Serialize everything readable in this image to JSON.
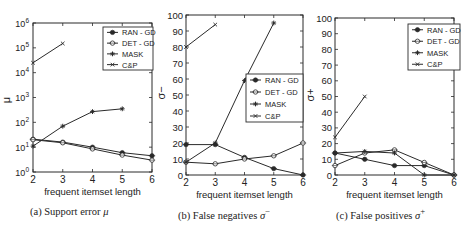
{
  "chart_data": [
    {
      "id": "a",
      "type": "line",
      "title": "",
      "caption": "(a) Support error μ",
      "caption_prefix": "(a)  Support error ",
      "caption_symbol": "μ",
      "xlabel": "frequent itemset length",
      "ylabel": "μ",
      "yscale": "log",
      "x_ticks": [
        2,
        3,
        4,
        5,
        6
      ],
      "y_ticks": [
        1,
        10,
        100,
        1000,
        10000,
        100000,
        1000000
      ],
      "y_tick_labels": [
        "10^0",
        "10^1",
        "10^2",
        "10^3",
        "10^4",
        "10^5",
        "10^6"
      ],
      "xlim": [
        2,
        6
      ],
      "ylim": [
        1,
        1000000
      ],
      "legend_position": "upper right",
      "series": [
        {
          "name": "RAN-GD",
          "marker": "filled-circle",
          "x": [
            2,
            3,
            4,
            5,
            6
          ],
          "values": [
            21,
            16,
            10,
            6,
            4.5
          ]
        },
        {
          "name": "DET-GD",
          "marker": "open-circle",
          "x": [
            2,
            3,
            4,
            5,
            6
          ],
          "values": [
            20,
            15,
            8.5,
            4.8,
            3
          ]
        },
        {
          "name": "MASK",
          "marker": "star",
          "x": [
            2,
            3,
            4,
            5
          ],
          "values": [
            11,
            70,
            270,
            350
          ]
        },
        {
          "name": "C&P",
          "marker": "x",
          "x": [
            2,
            3
          ],
          "values": [
            25000,
            150000
          ]
        }
      ]
    },
    {
      "id": "b",
      "type": "line",
      "title": "",
      "caption": "(b) False negatives σ−",
      "caption_prefix": "(b)  False negatives ",
      "caption_symbol": "σ",
      "caption_sup": "−",
      "xlabel": "frequent itemset length",
      "ylabel": "σ−",
      "yscale": "linear",
      "x_ticks": [
        2,
        3,
        4,
        5,
        6
      ],
      "y_ticks": [
        0,
        10,
        20,
        30,
        40,
        50,
        60,
        70,
        80,
        90,
        100
      ],
      "xlim": [
        2,
        6
      ],
      "ylim": [
        0,
        100
      ],
      "legend_position": "center right",
      "series": [
        {
          "name": "RAN-GD",
          "marker": "filled-circle",
          "x": [
            2,
            3,
            4,
            5,
            6
          ],
          "values": [
            19,
            19,
            11,
            4,
            0
          ]
        },
        {
          "name": "DET-GD",
          "marker": "open-circle",
          "x": [
            2,
            3,
            4,
            5,
            6
          ],
          "values": [
            8,
            7,
            10,
            12,
            20
          ]
        },
        {
          "name": "MASK",
          "marker": "star",
          "x": [
            2,
            3,
            4,
            5
          ],
          "values": [
            8,
            20,
            59,
            95
          ]
        },
        {
          "name": "C&P",
          "marker": "x",
          "x": [
            2,
            3
          ],
          "values": [
            80,
            94
          ]
        }
      ]
    },
    {
      "id": "c",
      "type": "line",
      "title": "",
      "caption": "(c) False positives σ+",
      "caption_prefix": "(c)  False positives ",
      "caption_symbol": "σ",
      "caption_sup": "+",
      "xlabel": "frequent itemset length",
      "ylabel": "σ+",
      "yscale": "linear",
      "x_ticks": [
        2,
        3,
        4,
        5,
        6
      ],
      "y_ticks": [
        0,
        10,
        20,
        30,
        40,
        50,
        60,
        70,
        80,
        90,
        100
      ],
      "xlim": [
        2,
        6
      ],
      "ylim": [
        0,
        100
      ],
      "legend_position": "upper right",
      "series": [
        {
          "name": "RAN-GD",
          "marker": "filled-circle",
          "x": [
            2,
            3,
            4,
            5,
            6
          ],
          "values": [
            14,
            10,
            6,
            6,
            0
          ]
        },
        {
          "name": "DET-GD",
          "marker": "open-circle",
          "x": [
            2,
            3,
            4,
            5,
            6
          ],
          "values": [
            6,
            14,
            16,
            8,
            0
          ]
        },
        {
          "name": "MASK",
          "marker": "star",
          "x": [
            2,
            3,
            4,
            5,
            6
          ],
          "values": [
            14,
            15,
            14,
            0,
            0
          ]
        },
        {
          "name": "C&P",
          "marker": "x",
          "x": [
            2,
            3
          ],
          "values": [
            24,
            50
          ]
        }
      ]
    }
  ],
  "layout": {
    "panels": [
      {
        "left": 33,
        "right": 152,
        "top": 23,
        "bottom": 172,
        "legend": {
          "x": 103,
          "y": 27,
          "w": 50,
          "h": 43
        },
        "ylabel_x": 10,
        "ylabel_y": 100,
        "caption_x": 30
      },
      {
        "left": 186,
        "right": 303,
        "top": 15,
        "bottom": 175,
        "legend": {
          "x": 246,
          "y": 74,
          "w": 57,
          "h": 48
        },
        "ylabel_x": 165,
        "ylabel_y": 93,
        "caption_x": 178
      },
      {
        "left": 335,
        "right": 454,
        "top": 18,
        "bottom": 175,
        "legend": {
          "x": 408,
          "y": 24,
          "w": 52,
          "h": 46
        },
        "ylabel_x": 314,
        "ylabel_y": 95,
        "caption_x": 336
      }
    ]
  }
}
